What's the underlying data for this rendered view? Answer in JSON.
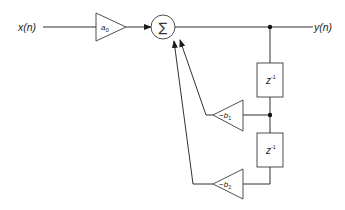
{
  "diagram": {
    "title": "",
    "type": "IIR filter block diagram (direct form)",
    "input_label": "x(n)",
    "output_label": "y(n)",
    "gain_forward": {
      "symbol": "a",
      "subscript": "0"
    },
    "summer_symbol": "∑",
    "delays": [
      {
        "base": "z",
        "exp": "-1"
      },
      {
        "base": "z",
        "exp": "-1"
      }
    ],
    "feedback_gains": [
      {
        "prefix": "−b",
        "subscript": "1"
      },
      {
        "prefix": "−b",
        "subscript": "2"
      }
    ],
    "colors": {
      "line": "#1a1a1a",
      "shape_stroke": "#3a3a3a",
      "background": "#ffffff"
    }
  }
}
